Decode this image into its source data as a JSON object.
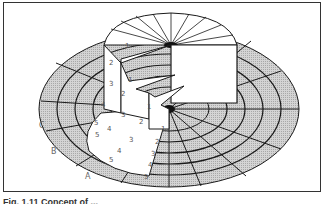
{
  "figure": {
    "caption": "Fig. 1.11 Concept of ...",
    "ring_labels": [
      "A",
      "B",
      "C"
    ],
    "top_cylinder_numbers": [
      "1",
      "2",
      "3",
      "4",
      "5"
    ],
    "inner_cut_numbers": [
      "1",
      "2",
      "3",
      "4",
      "5"
    ],
    "front_slice_numbers": [
      "1",
      "2",
      "3",
      "4",
      "5"
    ],
    "second_cut_numbers": [
      "1",
      "2",
      "3",
      "4",
      "5"
    ],
    "colors": {
      "hatch": "#c8c8c8",
      "line": "#1a1a1a",
      "face": "#ffffff"
    }
  }
}
